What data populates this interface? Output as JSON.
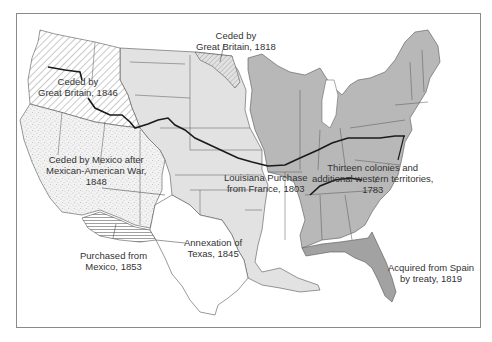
{
  "map": {
    "subject": "Territorial expansion of the United States",
    "colors": {
      "background": "#ffffff",
      "frame": "#8a8a8a",
      "thirteen_colonies": "#b8b8b8",
      "louisiana_purchase": "#e2e2e2",
      "florida": "#a2a2a2",
      "texas": "#ffffff",
      "borders": "#555555",
      "trail": "#1a1a1a"
    },
    "regions": [
      {
        "id": "oregon",
        "label_lines": [
          "Ceded by",
          "Great Britain, 1846"
        ],
        "pattern": "diagonal-hatch"
      },
      {
        "id": "red-river",
        "label_lines": [
          "Ceded by",
          "Great Britain, 1818"
        ],
        "pattern": "diagonal-hatch"
      },
      {
        "id": "mexican-cession",
        "label_lines": [
          "Ceded by Mexico after",
          "Mexican-American War,",
          "1848"
        ],
        "pattern": "stipple"
      },
      {
        "id": "louisiana",
        "label_lines": [
          "Louisiana Purchase",
          "from France, 1803"
        ],
        "pattern": "light-gray"
      },
      {
        "id": "thirteen-colonies",
        "label_lines": [
          "Thirteen colonies and",
          "additional western territories,",
          "1783"
        ],
        "pattern": "medium-gray"
      },
      {
        "id": "texas",
        "label_lines": [
          "Annexation of",
          "Texas, 1845"
        ],
        "pattern": "white"
      },
      {
        "id": "gadsden",
        "label_lines": [
          "Purchased from",
          "Mexico, 1853"
        ],
        "pattern": "horizontal-lines"
      },
      {
        "id": "florida",
        "label_lines": [
          "Acquired from Spain",
          "by treaty, 1819"
        ],
        "pattern": "dark-gray"
      }
    ]
  }
}
